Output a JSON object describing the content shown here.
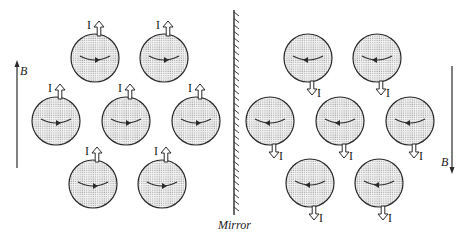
{
  "figure": {
    "mirror_label": "Mirror",
    "current_label": "I",
    "field_label": "B",
    "colors": {
      "ink": "#2a2a2a",
      "fill": "#e4e4e4",
      "dot": "#8a8a8a",
      "background": "#ffffff"
    },
    "left_side": {
      "field_direction": "up",
      "current_direction": "up",
      "rotation_arrow_direction": "right",
      "circles": [
        {
          "cx": 95,
          "cy": 58
        },
        {
          "cx": 164,
          "cy": 58
        },
        {
          "cx": 56,
          "cy": 121
        },
        {
          "cx": 126,
          "cy": 121
        },
        {
          "cx": 196,
          "cy": 121
        },
        {
          "cx": 93,
          "cy": 184
        },
        {
          "cx": 162,
          "cy": 184
        }
      ]
    },
    "right_side": {
      "field_direction": "down",
      "current_direction": "down",
      "rotation_arrow_direction": "left",
      "circles": [
        {
          "cx": 308,
          "cy": 58
        },
        {
          "cx": 377,
          "cy": 58
        },
        {
          "cx": 270,
          "cy": 121
        },
        {
          "cx": 340,
          "cy": 121
        },
        {
          "cx": 410,
          "cy": 121
        },
        {
          "cx": 310,
          "cy": 183
        },
        {
          "cx": 379,
          "cy": 183
        }
      ]
    }
  }
}
